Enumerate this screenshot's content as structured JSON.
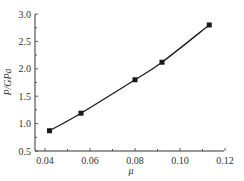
{
  "chart_data": {
    "type": "line",
    "title": "",
    "xlabel": "μ",
    "ylabel": "P/GPa",
    "xlim": [
      0.0355,
      0.12
    ],
    "ylim": [
      0.5,
      3.0
    ],
    "x_ticks": [
      0.04,
      0.06,
      0.08,
      0.1,
      0.12
    ],
    "x_tick_labels": [
      "0.04",
      "0.06",
      "0.08",
      "0.10",
      "0.12"
    ],
    "y_ticks": [
      0.5,
      1.0,
      1.5,
      2.0,
      2.5,
      3.0
    ],
    "y_tick_labels": [
      "0.5",
      "1.0",
      "1.5",
      "2.0",
      "2.5",
      "3.0"
    ],
    "x_minor_step": 0.01,
    "y_minor_step": 0.25,
    "grid": false,
    "legend": null,
    "series": [
      {
        "name": "P",
        "marker": "square",
        "color": "#1a1a1a",
        "x": [
          0.042,
          0.056,
          0.08,
          0.092,
          0.113
        ],
        "y": [
          0.87,
          1.19,
          1.8,
          2.12,
          2.8
        ]
      }
    ]
  },
  "colors": {
    "axis": "#333333",
    "line": "#1a1a1a",
    "background": "#ffffff"
  }
}
